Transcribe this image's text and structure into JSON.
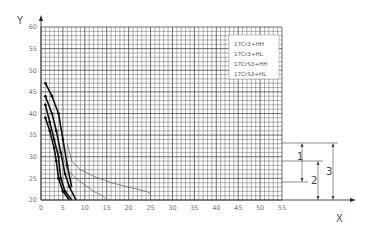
{
  "chart_data": {
    "type": "line",
    "title": "",
    "xlabel": "X",
    "ylabel": "Y",
    "xlim": [
      0,
      55
    ],
    "ylim": [
      20,
      60
    ],
    "x_ticks": [
      0,
      5,
      10,
      15,
      20,
      25,
      30,
      35,
      40,
      45,
      50,
      55
    ],
    "y_ticks": [
      20,
      25,
      30,
      35,
      40,
      45,
      50,
      55,
      60
    ],
    "grid": true,
    "legend_position": "upper-right inside plot",
    "legend": [
      "17Cr3+HH",
      "17Cr3+HL",
      "17CrS3+HH",
      "17CrS3+HL"
    ],
    "series": [
      {
        "name": "17Cr3+HH",
        "style": "thick with markers",
        "x": [
          1,
          2.5,
          4,
          5,
          6,
          7
        ],
        "y": [
          47,
          44,
          40,
          34,
          28,
          23
        ]
      },
      {
        "name": "17Cr3+HL",
        "style": "thick with markers",
        "x": [
          1,
          2.5,
          3.5,
          4.5,
          5.5,
          6.5,
          8
        ],
        "y": [
          44,
          40,
          36,
          31,
          26,
          23,
          20
        ]
      },
      {
        "name": "17CrS3+HH",
        "style": "thick with markers",
        "x": [
          1,
          2,
          3,
          4,
          4.5,
          5.5,
          7
        ],
        "y": [
          42,
          38,
          34,
          30,
          25,
          22,
          20
        ]
      },
      {
        "name": "17CrS3+HL",
        "style": "thick with markers",
        "x": [
          1,
          2,
          3,
          3.5,
          4,
          5,
          6.5
        ],
        "y": [
          39,
          36,
          32,
          29,
          25,
          22,
          20
        ]
      },
      {
        "name": "thin-curve-a",
        "style": "thin",
        "x": [
          6,
          7,
          9,
          12,
          16,
          20,
          24,
          25
        ],
        "y": [
          33,
          29,
          27,
          25.5,
          24,
          23,
          22,
          21.5
        ]
      },
      {
        "name": "thin-curve-b",
        "style": "thin",
        "x": [
          5,
          6,
          8,
          10,
          12,
          14,
          15
        ],
        "y": [
          30,
          27,
          25,
          23.5,
          22,
          21,
          20
        ]
      }
    ],
    "annotations": {
      "dimension_labels": [
        "1",
        "2",
        "3"
      ],
      "description": "Vertical dimension arrows right of the plot: 1 spans y≈31.5 to y≈25, 2 spans y≈29 to y=20, 3 spans y≈31.5 to y=20"
    }
  },
  "axes": {
    "x_label": "X",
    "y_label": "Y"
  },
  "legend": {
    "items": [
      "17Cr3+HH",
      "17Cr3+HL",
      "17CrS3+HH",
      "17CrS3+HL"
    ]
  },
  "dimensions": {
    "d1": "1",
    "d2": "2",
    "d3": "3"
  }
}
